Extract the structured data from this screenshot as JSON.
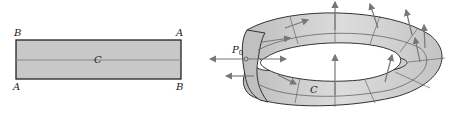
{
  "figure": {
    "left_panel": {
      "description": "flat rectangular strip before twisting",
      "corner_labels": {
        "top_left": "B",
        "top_right": "A",
        "bottom_left": "A",
        "bottom_right": "B"
      },
      "centerline_label": "C",
      "fill_color": "#c8c8c8",
      "border_color": "#222222"
    },
    "right_panel": {
      "description": "Möbius strip with normal vectors",
      "point_label": "P",
      "point_subscript": "0",
      "curve_label": "C",
      "surface_color": "#d4d4d4",
      "arrow_color": "#777777"
    }
  }
}
